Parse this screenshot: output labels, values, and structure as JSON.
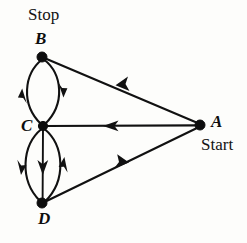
{
  "diagram": {
    "kind": "directed-graph",
    "title_text": "",
    "background_color": "#fdfdfb",
    "ink_color": "#111111",
    "nodes": [
      {
        "id": "A",
        "label": "A",
        "annotation": "Start",
        "x": 200,
        "y": 125,
        "radius": 5.0
      },
      {
        "id": "B",
        "label": "B",
        "annotation": "Stop",
        "x": 42,
        "y": 57,
        "radius": 5.0
      },
      {
        "id": "C",
        "label": "C",
        "annotation": "",
        "x": 43,
        "y": 126,
        "radius": 4.6
      },
      {
        "id": "D",
        "label": "D",
        "annotation": "",
        "x": 42,
        "y": 203,
        "radius": 5.0
      }
    ],
    "edges": [
      {
        "id": "e-a-b",
        "from": "A",
        "to": "B",
        "shape": "straight",
        "arrow_at": {
          "x": 122,
          "y": 88
        },
        "direction": "A to B"
      },
      {
        "id": "e-a-c",
        "from": "A",
        "to": "C",
        "shape": "straight",
        "arrow_at": {
          "x": 110,
          "y": 126
        },
        "direction": "A to C"
      },
      {
        "id": "e-d-a",
        "from": "D",
        "to": "A",
        "shape": "straight",
        "arrow_at": {
          "x": 122,
          "y": 167
        },
        "direction": "D to A"
      },
      {
        "id": "e-c-b",
        "from": "C",
        "to": "B",
        "shape": "curve-left",
        "arrow_at": {
          "x": 24,
          "y": 95
        },
        "direction": "C to B"
      },
      {
        "id": "e-b-c",
        "from": "B",
        "to": "C",
        "shape": "curve-right",
        "arrow_at": {
          "x": 61,
          "y": 90
        },
        "direction": "B to C"
      },
      {
        "id": "e-c-d-left",
        "from": "C",
        "to": "D",
        "shape": "curve-left",
        "arrow_at": {
          "x": 23,
          "y": 167
        },
        "direction": "C to D"
      },
      {
        "id": "e-c-d-mid",
        "from": "C",
        "to": "D",
        "shape": "straight",
        "arrow_at": {
          "x": 43,
          "y": 168
        },
        "direction": "C to D"
      },
      {
        "id": "e-d-c-right",
        "from": "D",
        "to": "C",
        "shape": "curve-right",
        "arrow_at": {
          "x": 63,
          "y": 163
        },
        "direction": "D to C"
      }
    ],
    "labels": {
      "stop": "Stop",
      "start": "Start",
      "node_a": "A",
      "node_b": "B",
      "node_c": "C",
      "node_d": "D"
    }
  }
}
